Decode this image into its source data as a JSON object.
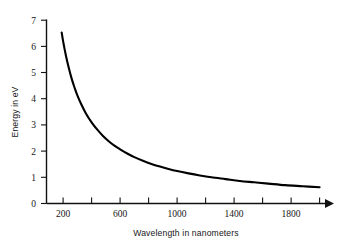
{
  "chart_data": {
    "type": "line",
    "title": "",
    "xlabel": "Wavelength in nanometers",
    "ylabel": "Energy in eV",
    "xlim": [
      100,
      2050
    ],
    "ylim": [
      0,
      7
    ],
    "grid": false,
    "legend": null,
    "relation": "E = 1240 / lambda",
    "x_tick_values": [
      200,
      400,
      600,
      800,
      1000,
      1200,
      1400,
      1600,
      1800,
      2000
    ],
    "x_tick_labels": [
      "200",
      "",
      "600",
      "",
      "1000",
      "",
      "1400",
      "",
      "1800",
      ""
    ],
    "y_tick_values": [
      0,
      1,
      2,
      3,
      4,
      5,
      6,
      7
    ],
    "y_tick_labels": [
      "0",
      "1",
      "2",
      "3",
      "4",
      "5",
      "6",
      "7"
    ],
    "series": [
      {
        "name": "photon energy",
        "x": [
          190,
          200,
          220,
          240,
          260,
          280,
          300,
          330,
          360,
          400,
          440,
          480,
          520,
          560,
          600,
          650,
          700,
          760,
          820,
          880,
          940,
          1000,
          1080,
          1160,
          1240,
          1340,
          1440,
          1540,
          1640,
          1760,
          1880,
          2000
        ],
        "y": [
          6.53,
          6.2,
          5.64,
          5.17,
          4.77,
          4.43,
          4.13,
          3.76,
          3.44,
          3.1,
          2.82,
          2.58,
          2.38,
          2.21,
          2.07,
          1.91,
          1.77,
          1.63,
          1.51,
          1.41,
          1.32,
          1.24,
          1.15,
          1.07,
          1.0,
          0.93,
          0.86,
          0.81,
          0.76,
          0.7,
          0.66,
          0.62
        ]
      }
    ],
    "colors": {
      "curve": "#000000",
      "axis": "#111111",
      "text": "#161616",
      "background": "#ffffff"
    },
    "annotations": {
      "x_axis_arrow": "right-pointing arrowhead at end of x-axis"
    }
  }
}
